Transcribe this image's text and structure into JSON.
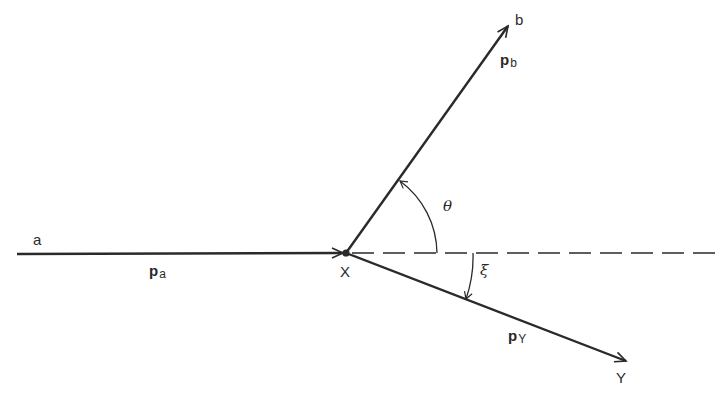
{
  "diagram": {
    "type": "two-body decay / scattering kinematics",
    "colors": {
      "line": "#2a2a2a",
      "background": "#ffffff"
    },
    "vertex": {
      "label": "X",
      "x": 346,
      "y": 253
    },
    "particles": [
      {
        "id": "a",
        "label": "a",
        "momentum_symbol": "p",
        "momentum_subscript": "a",
        "direction": "incoming"
      },
      {
        "id": "b",
        "label": "b",
        "momentum_symbol": "p",
        "momentum_subscript": "b",
        "direction": "outgoing"
      },
      {
        "id": "Y",
        "label": "Y",
        "momentum_symbol": "p",
        "momentum_subscript": "Y",
        "direction": "outgoing"
      }
    ],
    "angles": [
      {
        "symbol": "θ",
        "between": [
          "dashed-axis",
          "b"
        ],
        "side": "above"
      },
      {
        "symbol": "ξ",
        "between": [
          "dashed-axis",
          "Y"
        ],
        "side": "below"
      }
    ],
    "reference_axis": {
      "style": "dashed",
      "description": "continuation of incoming direction"
    }
  }
}
